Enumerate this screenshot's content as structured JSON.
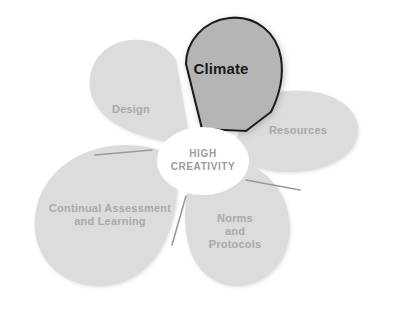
{
  "diagram": {
    "title": "HIGH CREATIVITY",
    "center": {
      "line1": "HIGH",
      "line2": "CREATIVITY",
      "text": "HIGH\nCREATIVITY",
      "text_color": "#9b9b9b",
      "fill_color": "#ffffff"
    },
    "colors": {
      "background": "#ffffff",
      "petal_fill": "#dcdcdc",
      "petal_fill_highlight": "#b5b5b5",
      "petal_outline_highlight": "#1a1a1a",
      "divider_line": "#9a9a9a",
      "label_text": "#a9a9a9",
      "label_text_highlight": "#1a1a1a"
    },
    "petals": [
      {
        "id": "climate",
        "label": "Climate",
        "highlighted": true,
        "position": "top"
      },
      {
        "id": "design",
        "label": "Design",
        "highlighted": false,
        "position": "upper-left"
      },
      {
        "id": "resources",
        "label": "Resources",
        "highlighted": false,
        "position": "right"
      },
      {
        "id": "continual-assessment-and-learning",
        "label": "Continual Assessment\nand Learning",
        "highlighted": false,
        "position": "lower-left"
      },
      {
        "id": "norms-and-protocols",
        "label": "Norms\nand\nProtocols",
        "highlighted": false,
        "position": "lower-right"
      }
    ]
  }
}
